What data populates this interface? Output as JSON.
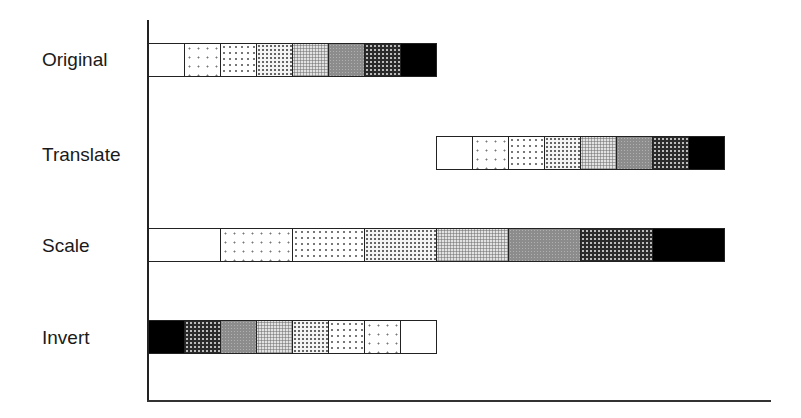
{
  "diagram": {
    "rows": [
      {
        "label": "Original",
        "transform": "original",
        "start_cell": 0,
        "cell_width_units": 1,
        "order": "light-to-dark"
      },
      {
        "label": "Translate",
        "transform": "translate",
        "start_cell": 8,
        "cell_width_units": 1,
        "order": "light-to-dark"
      },
      {
        "label": "Scale",
        "transform": "scale",
        "start_cell": 0,
        "cell_width_units": 2,
        "order": "light-to-dark"
      },
      {
        "label": "Invert",
        "transform": "invert",
        "start_cell": 0,
        "cell_width_units": 1,
        "order": "dark-to-light"
      }
    ],
    "shades": [
      "white",
      "sparse-dots",
      "light-dots",
      "dense-dots",
      "light-gray-stipple",
      "mid-gray",
      "dark-stipple",
      "black"
    ],
    "colors": {
      "stroke": "#222222",
      "background": "#ffffff",
      "black": "#000000",
      "mid_gray": "#8c8c8c"
    }
  }
}
